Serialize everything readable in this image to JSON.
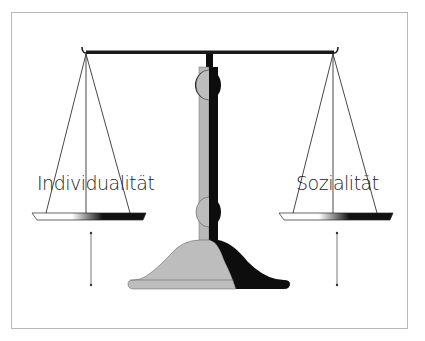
{
  "diagram": {
    "type": "balance-scale",
    "labels": {
      "left_pan": "Individualität",
      "right_pan": "Sozialität"
    },
    "colors": {
      "beam": "#1a1a1a",
      "column_light": "#b8b8b8",
      "column_dark": "#0d0d0d",
      "base_light": "#bdbdbd",
      "base_dark": "#0d0d0d",
      "strings": "#333333",
      "frame_border": "#b9b9b9",
      "background": "#ffffff"
    },
    "arrows": [
      {
        "side": "left",
        "direction": "vertical",
        "style": "thin double-ended"
      },
      {
        "side": "right",
        "direction": "vertical",
        "style": "thin double-ended"
      }
    ]
  }
}
